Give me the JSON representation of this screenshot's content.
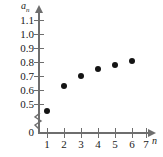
{
  "chart_data": {
    "type": "scatter",
    "title": "",
    "xlabel": "n",
    "ylabel": "a_n",
    "x": [
      1,
      2,
      3,
      4,
      5,
      6
    ],
    "values": [
      0.49,
      0.67,
      0.74,
      0.79,
      0.82,
      0.85
    ],
    "points": [
      {
        "x": 1,
        "y": 0.49
      },
      {
        "x": 2,
        "y": 0.67
      },
      {
        "x": 3,
        "y": 0.74
      },
      {
        "x": 4,
        "y": 0.79
      },
      {
        "x": 5,
        "y": 0.82
      },
      {
        "x": 6,
        "y": 0.85
      }
    ],
    "xlim": [
      0,
      7
    ],
    "ylim": [
      0.45,
      1.15
    ],
    "xticks": [
      "1",
      "2",
      "3",
      "4",
      "5",
      "6",
      "7"
    ],
    "yticks": [
      "0",
      "0.5",
      "0.6",
      "0.7",
      "0.8",
      "0.9",
      "1.0",
      "1.1"
    ],
    "grid": false,
    "legend": null,
    "axis_break": {
      "axis": "y",
      "between": [
        "0",
        "0.5"
      ],
      "symbol": "zigzag"
    },
    "marker": {
      "shape": "filled-circle",
      "color": "#141414",
      "size": 6
    },
    "axis_color": "#6e6e6e",
    "text_color": "#1a1a1a",
    "background": "#ffffff"
  },
  "axis": {
    "y_name_base": "a",
    "y_name_sub": "n",
    "x_name": "n"
  }
}
